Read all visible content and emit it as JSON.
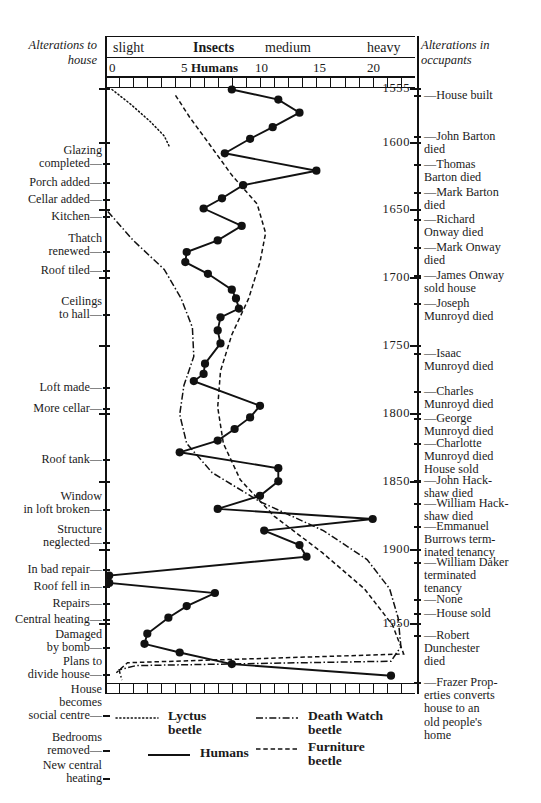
{
  "corners": {
    "left": "Alterations\nto house",
    "right": "Alterations\nin occupants"
  },
  "header": {
    "insects_row": [
      {
        "label": "slight",
        "x": 8
      },
      {
        "label": "Insects",
        "x": 88,
        "bold": true
      },
      {
        "label": "medium",
        "x": 160
      },
      {
        "label": "heavy",
        "x": 262
      }
    ],
    "humans_row": [
      {
        "label": "0",
        "x": 4
      },
      {
        "label": "5",
        "x": 76
      },
      {
        "label": "Humans",
        "x": 86,
        "bold": true
      },
      {
        "label": "10",
        "x": 150
      },
      {
        "label": "15",
        "x": 208
      },
      {
        "label": "20",
        "x": 262
      }
    ]
  },
  "axis": {
    "x_label_insects": "Insects",
    "x_label_humans": "Humans",
    "x_ticks": [
      0,
      5,
      10,
      15,
      20
    ],
    "x_range": [
      0,
      22
    ],
    "y_year_labels": [
      "1555",
      "1600",
      "1650",
      "1700",
      "1750",
      "1800",
      "1850",
      "1900",
      "1950"
    ],
    "y_range": [
      1540,
      1970
    ]
  },
  "events_left": [
    {
      "text": "Glazing\ncompleted—",
      "y": 144
    },
    {
      "text": "Porch added—",
      "y": 176
    },
    {
      "text": "Cellar added—",
      "y": 193
    },
    {
      "text": "Kitchen—",
      "y": 210
    },
    {
      "text": "Thatch\nrenewed—",
      "y": 232
    },
    {
      "text": "Roof tiled—",
      "y": 264
    },
    {
      "text": "Ceilings\nto hall—",
      "y": 295
    },
    {
      "text": "Loft made—",
      "y": 381
    },
    {
      "text": "More cellar—",
      "y": 402
    },
    {
      "text": "Roof tank—",
      "y": 453
    },
    {
      "text": "Window\nin loft broken—",
      "y": 490
    },
    {
      "text": "Structure\nneglected—",
      "y": 523
    },
    {
      "text": "In bad repair—",
      "y": 563
    },
    {
      "text": "Roof fell in—",
      "y": 580
    },
    {
      "text": "Repairs—",
      "y": 597
    },
    {
      "text": "Central heating—",
      "y": 613
    },
    {
      "text": "Damaged\nby bomb—",
      "y": 628
    },
    {
      "text": "Plans to\ndivide house—",
      "y": 655
    },
    {
      "text": "House\nbecomes\nsocial centre—",
      "y": 683
    },
    {
      "text": "Bedrooms\nremoved—",
      "y": 731
    },
    {
      "text": "New central\nheating",
      "y": 759
    }
  ],
  "events_right": [
    {
      "text": "—House built",
      "y": 89
    },
    {
      "text": "—John Barton\n   died",
      "y": 130
    },
    {
      "text": "—Thomas\n   Barton died",
      "y": 158
    },
    {
      "text": "—Mark Barton\n   died",
      "y": 186
    },
    {
      "text": "—Richard\n   Onway died",
      "y": 213
    },
    {
      "text": "—Mark Onway\n   died",
      "y": 241
    },
    {
      "text": "—James Onway\n   sold house",
      "y": 269
    },
    {
      "text": "—Joseph\n   Munroyd died",
      "y": 297
    },
    {
      "text": "—Isaac\n   Munroyd died",
      "y": 347
    },
    {
      "text": "—Charles\n   Munroyd died",
      "y": 385
    },
    {
      "text": "—George\n   Munroyd died",
      "y": 412
    },
    {
      "text": "—Charlotte\n   Munroyd died\n   House sold",
      "y": 437
    },
    {
      "text": "—John Hack-\n   shaw died",
      "y": 474
    },
    {
      "text": "—William Hack-\n   shaw died",
      "y": 497
    },
    {
      "text": "—Emmanuel\n   Burrows term-\n   inated tenancy",
      "y": 520
    },
    {
      "text": "—William Daker\n   terminated\n   tenancy",
      "y": 556
    },
    {
      "text": "—None",
      "y": 593
    },
    {
      "text": "—House sold",
      "y": 607
    },
    {
      "text": "—Robert\n   Dunchester\n   died",
      "y": 629
    },
    {
      "text": "—Frazer Prop-\n   erties converts\n   house to an\n   old people's\n   home",
      "y": 676
    }
  ],
  "years": [
    {
      "label": "1555",
      "y": 88
    },
    {
      "label": "1600",
      "y": 142
    },
    {
      "label": "1650",
      "y": 209
    },
    {
      "label": "1700",
      "y": 277
    },
    {
      "label": "1750",
      "y": 345
    },
    {
      "label": "1800",
      "y": 413
    },
    {
      "label": "1850",
      "y": 481
    },
    {
      "label": "1900",
      "y": 549
    },
    {
      "label": "1950",
      "y": 623
    }
  ],
  "legend": [
    {
      "name": "Lyctus\nbeetle",
      "style": "lyctus",
      "x": 168,
      "y": 709
    },
    {
      "name": "Death Watch\nbeetle",
      "style": "death",
      "x": 308,
      "y": 709
    },
    {
      "name": "Humans",
      "style": "humans",
      "x": 200,
      "y": 746
    },
    {
      "name": "Furniture\nbeetle",
      "style": "furniture",
      "x": 308,
      "y": 740
    }
  ],
  "chart_data": {
    "type": "line",
    "orientation": "vertical-time",
    "xlabel": "Insects (slight / medium / heavy)  ·  Humans (0–20)",
    "ylabel": "Year",
    "xlim": [
      0,
      22
    ],
    "ylim": [
      1555,
      1965
    ],
    "grid": false,
    "legend_position": "bottom",
    "series": [
      {
        "name": "Humans",
        "style": "solid",
        "markers": true,
        "points": [
          {
            "year": 1556,
            "value": 9.0
          },
          {
            "year": 1563,
            "value": 12.3
          },
          {
            "year": 1572,
            "value": 13.8
          },
          {
            "year": 1582,
            "value": 11.9
          },
          {
            "year": 1590,
            "value": 10.3
          },
          {
            "year": 1600,
            "value": 8.5
          },
          {
            "year": 1612,
            "value": 15.0
          },
          {
            "year": 1622,
            "value": 9.8
          },
          {
            "year": 1631,
            "value": 8.3
          },
          {
            "year": 1638,
            "value": 7.0
          },
          {
            "year": 1650,
            "value": 9.7
          },
          {
            "year": 1660,
            "value": 8.0
          },
          {
            "year": 1668,
            "value": 5.8
          },
          {
            "year": 1675,
            "value": 5.7
          },
          {
            "year": 1683,
            "value": 7.3
          },
          {
            "year": 1694,
            "value": 9.0
          },
          {
            "year": 1700,
            "value": 9.3
          },
          {
            "year": 1707,
            "value": 9.5
          },
          {
            "year": 1713,
            "value": 8.2
          },
          {
            "year": 1722,
            "value": 8.0
          },
          {
            "year": 1731,
            "value": 8.2
          },
          {
            "year": 1745,
            "value": 7.1
          },
          {
            "year": 1752,
            "value": 7.0
          },
          {
            "year": 1757,
            "value": 6.3
          },
          {
            "year": 1774,
            "value": 11.0
          },
          {
            "year": 1782,
            "value": 10.3
          },
          {
            "year": 1790,
            "value": 9.2
          },
          {
            "year": 1798,
            "value": 8.0
          },
          {
            "year": 1806,
            "value": 5.3
          },
          {
            "year": 1817,
            "value": 12.3
          },
          {
            "year": 1826,
            "value": 12.3
          },
          {
            "year": 1836,
            "value": 11.0
          },
          {
            "year": 1845,
            "value": 8.0
          },
          {
            "year": 1852,
            "value": 19.0
          },
          {
            "year": 1860,
            "value": 11.3
          },
          {
            "year": 1870,
            "value": 13.8
          },
          {
            "year": 1878,
            "value": 14.3
          },
          {
            "year": 1891,
            "value": 0.3
          },
          {
            "year": 1896,
            "value": 0.3
          },
          {
            "year": 1903,
            "value": 7.8
          },
          {
            "year": 1912,
            "value": 5.8
          },
          {
            "year": 1920,
            "value": 4.5
          },
          {
            "year": 1931,
            "value": 3.0
          },
          {
            "year": 1938,
            "value": 2.8
          },
          {
            "year": 1944,
            "value": 5.3
          },
          {
            "year": 1952,
            "value": 9.0
          },
          {
            "year": 1960,
            "value": 20.3
          }
        ]
      },
      {
        "name": "Lyctus beetle",
        "style": "dotted",
        "markers": false,
        "points": [
          {
            "year": 1556,
            "value": 0.5
          },
          {
            "year": 1566,
            "value": 1.8
          },
          {
            "year": 1578,
            "value": 3.2
          },
          {
            "year": 1588,
            "value": 4.2
          },
          {
            "year": 1596,
            "value": 4.6
          }
        ]
      },
      {
        "name": "Death Watch beetle",
        "style": "dash-dot",
        "markers": false,
        "points": [
          {
            "year": 1640,
            "value": 0.2
          },
          {
            "year": 1660,
            "value": 2.0
          },
          {
            "year": 1680,
            "value": 4.2
          },
          {
            "year": 1700,
            "value": 5.4
          },
          {
            "year": 1720,
            "value": 6.2
          },
          {
            "year": 1740,
            "value": 6.3
          },
          {
            "year": 1760,
            "value": 5.6
          },
          {
            "year": 1780,
            "value": 5.3
          },
          {
            "year": 1800,
            "value": 5.8
          },
          {
            "year": 1820,
            "value": 7.6
          },
          {
            "year": 1840,
            "value": 11.0
          },
          {
            "year": 1860,
            "value": 15.5
          },
          {
            "year": 1880,
            "value": 18.6
          },
          {
            "year": 1900,
            "value": 20.2
          },
          {
            "year": 1920,
            "value": 20.8
          },
          {
            "year": 1940,
            "value": 21.0
          },
          {
            "year": 1950,
            "value": 20.3
          },
          {
            "year": 1953,
            "value": 2.2
          },
          {
            "year": 1956,
            "value": 1.0
          },
          {
            "year": 1963,
            "value": 1.2
          }
        ]
      },
      {
        "name": "Furniture beetle",
        "style": "dashed",
        "markers": false,
        "points": [
          {
            "year": 1560,
            "value": 5.0
          },
          {
            "year": 1575,
            "value": 6.0
          },
          {
            "year": 1595,
            "value": 7.5
          },
          {
            "year": 1615,
            "value": 9.0
          },
          {
            "year": 1635,
            "value": 10.8
          },
          {
            "year": 1655,
            "value": 11.4
          },
          {
            "year": 1675,
            "value": 11.0
          },
          {
            "year": 1700,
            "value": 10.2
          },
          {
            "year": 1725,
            "value": 9.0
          },
          {
            "year": 1750,
            "value": 8.2
          },
          {
            "year": 1775,
            "value": 8.0
          },
          {
            "year": 1800,
            "value": 8.4
          },
          {
            "year": 1825,
            "value": 9.6
          },
          {
            "year": 1850,
            "value": 12.0
          },
          {
            "year": 1875,
            "value": 15.4
          },
          {
            "year": 1900,
            "value": 18.4
          },
          {
            "year": 1925,
            "value": 20.4
          },
          {
            "year": 1945,
            "value": 21.2
          },
          {
            "year": 1951,
            "value": 1.6
          },
          {
            "year": 1958,
            "value": 0.8
          }
        ]
      }
    ]
  }
}
